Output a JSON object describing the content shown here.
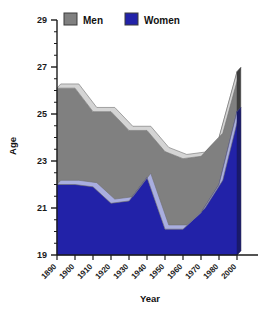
{
  "chart_data": {
    "type": "area",
    "title": "",
    "xlabel": "Year",
    "ylabel": "Age",
    "ylim": [
      19,
      29
    ],
    "ytick_labels": [
      "19",
      "21",
      "23",
      "25",
      "27",
      "29"
    ],
    "ytick_values": [
      19,
      21,
      23,
      25,
      27,
      29
    ],
    "minor_ticks": true,
    "grid": false,
    "legend_position": "top",
    "categories": [
      "1890",
      "1900",
      "1910",
      "1920",
      "1930",
      "1940",
      "1950",
      "1960",
      "1970",
      "1980",
      "2000"
    ],
    "x": [
      1890,
      1900,
      1910,
      1920,
      1930,
      1940,
      1950,
      1960,
      1970,
      1980,
      2000
    ],
    "series": [
      {
        "name": "Men",
        "color": "#808080",
        "values": [
          26.1,
          26.1,
          25.1,
          25.1,
          24.3,
          24.3,
          23.4,
          23.1,
          23.2,
          24.0,
          26.8
        ]
      },
      {
        "name": "Women",
        "color": "#2222a8",
        "values": [
          22.0,
          22.0,
          21.9,
          21.2,
          21.3,
          22.3,
          20.1,
          20.1,
          20.8,
          22.0,
          25.1
        ]
      }
    ]
  },
  "legend": {
    "items": [
      {
        "label": "Men",
        "color": "#808080"
      },
      {
        "label": "Women",
        "color": "#2222a8"
      }
    ]
  },
  "axes": {
    "y_title": "Age",
    "x_title": "Year"
  },
  "colors": {
    "men_fill": "#808080",
    "men_top": "#d4d4d4",
    "men_side": "#3d3d3d",
    "women_fill": "#2222a8",
    "women_top": "#a9aee0",
    "women_side": "#1a1a6b",
    "axis": "#1a1a1a",
    "background": "#ffffff"
  }
}
